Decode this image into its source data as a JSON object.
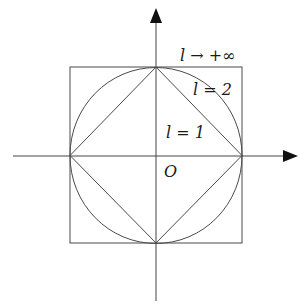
{
  "diagram": {
    "origin_label": "O",
    "labels": {
      "l_inf": "l → +∞",
      "l_2": "l = 2",
      "l_1": "l = 1"
    },
    "colors": {
      "stroke": "#4a4a4a",
      "axis": "#444444",
      "text": "#1a1a1a",
      "background": "#ffffff"
    }
  }
}
